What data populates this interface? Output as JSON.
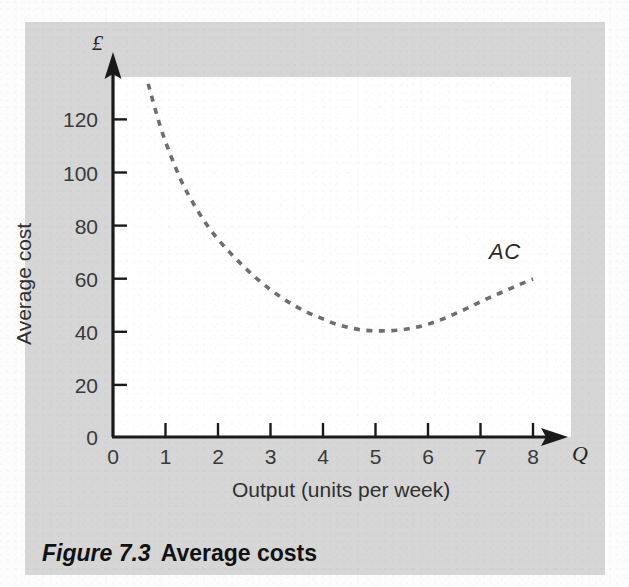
{
  "figure": {
    "caption_label": "Figure 7.3",
    "caption_title": "Average costs"
  },
  "axes": {
    "y_symbol": "£",
    "x_symbol": "Q",
    "y_title": "Average cost",
    "x_title": "Output (units per week)",
    "y_ticks": [
      "0",
      "20",
      "40",
      "60",
      "80",
      "100",
      "120"
    ],
    "x_ticks": [
      "0",
      "1",
      "2",
      "3",
      "4",
      "5",
      "6",
      "7",
      "8"
    ]
  },
  "series": {
    "label": "AC"
  },
  "colors": {
    "panel_background": "#d6d6d6",
    "plot_background": "#ffffff",
    "axis_line": "#1a1a1a",
    "curve": "#6d6d73",
    "text": "#2b2b2b"
  },
  "chart_data": {
    "type": "line",
    "xlabel": "Output (units per week)",
    "ylabel": "Average cost",
    "y_unit": "£",
    "xlim": [
      0,
      8.6
    ],
    "ylim": [
      0,
      136
    ],
    "xticks": [
      0,
      1,
      2,
      3,
      4,
      5,
      6,
      7,
      8
    ],
    "yticks": [
      0,
      20,
      40,
      60,
      80,
      100,
      120
    ],
    "grid": false,
    "legend": "none",
    "annotations": [
      {
        "text": "AC",
        "x": 7.3,
        "y": 71
      }
    ],
    "series": [
      {
        "name": "AC",
        "style": "dashed",
        "color": "#6d6d73",
        "x": [
          0.67,
          0.9,
          1.1,
          1.3,
          1.5,
          1.75,
          2.0,
          2.25,
          2.5,
          2.75,
          3.0,
          3.25,
          3.5,
          3.75,
          4.0,
          4.25,
          4.5,
          4.75,
          5.0,
          5.25,
          5.5,
          5.75,
          6.0,
          6.25,
          6.5,
          6.75,
          7.0,
          7.25,
          7.5,
          7.75,
          8.0
        ],
        "y": [
          133,
          117,
          106,
          96.5,
          89,
          81,
          74.5,
          69,
          64,
          59.5,
          55.5,
          52,
          49,
          46.5,
          44.5,
          42.5,
          41.2,
          40.3,
          40.0,
          40.0,
          40.4,
          41.2,
          42.5,
          44.2,
          46.3,
          48.5,
          51.0,
          53.2,
          55.3,
          57.5,
          59.5
        ]
      }
    ]
  },
  "geometry": {
    "origin_x": 113,
    "origin_y": 437,
    "px_per_x_unit": 52.5,
    "px_per_y_unit": 2.655,
    "plot_top": 77,
    "plot_right": 571
  }
}
